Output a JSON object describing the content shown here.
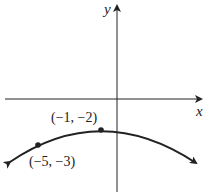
{
  "axes": {
    "x_label": "x",
    "y_label": "y"
  },
  "points": [
    {
      "label": "(−1, −2)",
      "x": -1,
      "y": -2,
      "role": "vertex"
    },
    {
      "label": "(−5, −3)",
      "x": -5,
      "y": -3,
      "role": "point"
    }
  ],
  "curve": {
    "type": "downward-opening parabola",
    "vertex": [
      -1,
      -2
    ],
    "passes_through": [
      -5,
      -3
    ],
    "arrows_both_ends": true
  },
  "colors": {
    "stroke": "#222222",
    "background": "#ffffff"
  }
}
